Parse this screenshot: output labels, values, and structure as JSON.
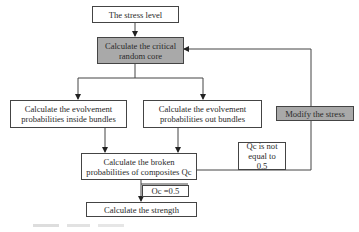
{
  "diagram": {
    "type": "flowchart",
    "nodes": {
      "stress_level": {
        "label": "The stress level",
        "style": "plain"
      },
      "critical_core": {
        "label": "Calculate the critical random core",
        "style": "gray"
      },
      "inside_bundles": {
        "label": "Calculate the evolvement probabilities inside bundles",
        "style": "plain"
      },
      "out_bundles": {
        "label": "Calculate the evolvement probabilities out bundles",
        "style": "plain"
      },
      "modify_stress": {
        "label": "Modify the stress",
        "style": "gray"
      },
      "broken_prob": {
        "label": "Calculate the broken probabilities of composites Qc",
        "style": "plain"
      },
      "not_equal": {
        "label": "Qc is not equal to 0.5",
        "style": "plain"
      },
      "equal": {
        "label": "Oc =0.5",
        "style": "plain"
      },
      "strength": {
        "label": "Calculate the strength",
        "style": "plain"
      }
    },
    "edges": [
      {
        "from": "stress_level",
        "to": "critical_core"
      },
      {
        "from": "critical_core",
        "to": "inside_bundles"
      },
      {
        "from": "critical_core",
        "to": "out_bundles"
      },
      {
        "from": "inside_bundles",
        "to": "broken_prob"
      },
      {
        "from": "out_bundles",
        "to": "broken_prob"
      },
      {
        "from": "broken_prob",
        "to": "modify_stress",
        "label": "Qc is not equal to 0.5"
      },
      {
        "from": "modify_stress",
        "to": "critical_core"
      },
      {
        "from": "broken_prob",
        "to": "strength",
        "label": "Oc =0.5"
      }
    ],
    "colors": {
      "gray_fill": "#a9a9a9",
      "line": "#444444",
      "background": "#ffffff"
    }
  }
}
